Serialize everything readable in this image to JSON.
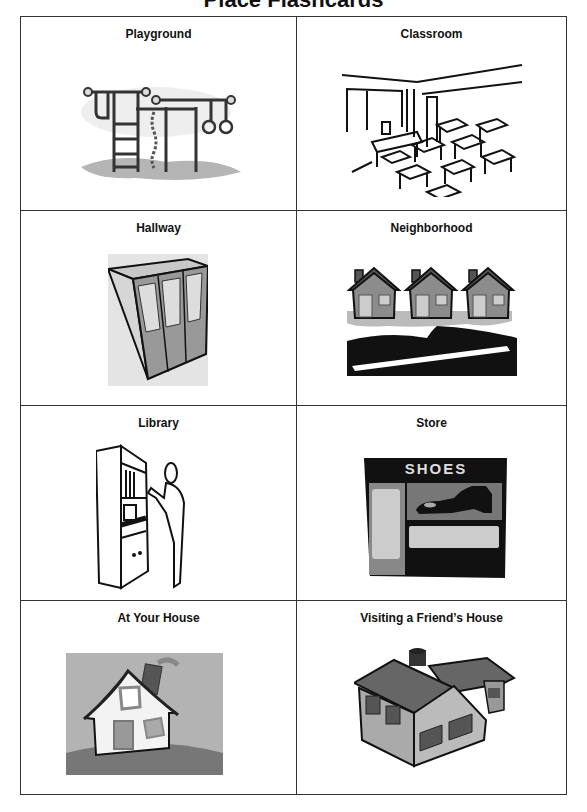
{
  "page": {
    "title": "Place Flashcards"
  },
  "cards": [
    {
      "label": "Playground",
      "icon": "playground-icon"
    },
    {
      "label": "Classroom",
      "icon": "classroom-icon"
    },
    {
      "label": "Hallway",
      "icon": "lockers-icon"
    },
    {
      "label": "Neighborhood",
      "icon": "houses-street-icon"
    },
    {
      "label": "Library",
      "icon": "bookshelf-person-icon"
    },
    {
      "label": "Store",
      "icon": "shoe-store-icon",
      "sign_text": "SHOES"
    },
    {
      "label": "At Your House",
      "icon": "house-icon"
    },
    {
      "label": "Visiting a Friend’s House",
      "icon": "friend-house-icon"
    }
  ],
  "colors": {
    "border": "#333333",
    "ink": "#111111",
    "mid_gray": "#8a8a8a",
    "light_gray": "#c8c8c8"
  }
}
